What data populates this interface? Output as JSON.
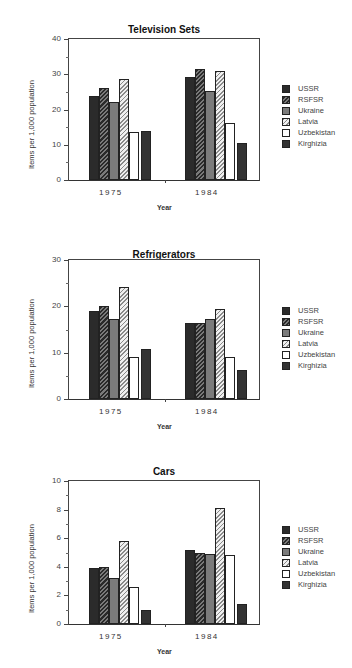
{
  "chart_data": [
    {
      "type": "bar",
      "title": "Television Sets",
      "xlabel": "Year",
      "ylabel": "Items per 1,000 population",
      "categories": [
        "1975",
        "1984"
      ],
      "ylim": [
        0,
        40
      ],
      "yticks": [
        "0",
        "10",
        "20",
        "30",
        "40"
      ],
      "legend_position": "right",
      "series": [
        {
          "name": "USSR",
          "values": [
            23.8,
            29.2
          ]
        },
        {
          "name": "RSFSR",
          "values": [
            26.2,
            31.5
          ]
        },
        {
          "name": "Ukraine",
          "values": [
            22.0,
            25.3
          ]
        },
        {
          "name": "Latvia",
          "values": [
            28.6,
            31.0
          ]
        },
        {
          "name": "Uzbekistan",
          "values": [
            13.6,
            16.3
          ]
        },
        {
          "name": "Kirghizia",
          "values": [
            13.8,
            10.4
          ]
        }
      ]
    },
    {
      "type": "bar",
      "title": "Refrigerators",
      "xlabel": "Year",
      "ylabel": "Items per 1,000 population",
      "categories": [
        "1975",
        "1984"
      ],
      "ylim": [
        0,
        30
      ],
      "yticks": [
        "0",
        "10",
        "20",
        "30"
      ],
      "legend_position": "right",
      "series": [
        {
          "name": "USSR",
          "values": [
            18.9,
            16.4
          ]
        },
        {
          "name": "RSFSR",
          "values": [
            20.0,
            16.4
          ]
        },
        {
          "name": "Ukraine",
          "values": [
            17.2,
            17.3
          ]
        },
        {
          "name": "Latvia",
          "values": [
            24.2,
            19.5
          ]
        },
        {
          "name": "Uzbekistan",
          "values": [
            9.0,
            9.0
          ]
        },
        {
          "name": "Kirghizia",
          "values": [
            10.9,
            6.3
          ]
        }
      ]
    },
    {
      "type": "bar",
      "title": "Cars",
      "xlabel": "Year",
      "ylabel": "Items per 1,000 population",
      "categories": [
        "1975",
        "1984"
      ],
      "ylim": [
        0,
        10
      ],
      "yticks": [
        "0",
        "2",
        "4",
        "6",
        "8",
        "10"
      ],
      "legend_position": "right",
      "series": [
        {
          "name": "USSR",
          "values": [
            3.9,
            5.2
          ]
        },
        {
          "name": "RSFSR",
          "values": [
            4.0,
            5.0
          ]
        },
        {
          "name": "Ukraine",
          "values": [
            3.2,
            4.9
          ]
        },
        {
          "name": "Latvia",
          "values": [
            5.8,
            8.1
          ]
        },
        {
          "name": "Uzbekistan",
          "values": [
            2.6,
            4.8
          ]
        },
        {
          "name": "Kirghizia",
          "values": [
            1.0,
            1.4
          ]
        }
      ]
    }
  ],
  "legend": {
    "items": [
      {
        "label": "USSR",
        "pattern": "p-ussr"
      },
      {
        "label": "RSFSR",
        "pattern": "p-rsfsr"
      },
      {
        "label": "Ukraine",
        "pattern": "p-ukraine"
      },
      {
        "label": "Latvia",
        "pattern": "p-latvia"
      },
      {
        "label": "Uzbekistan",
        "pattern": "p-uzbek"
      },
      {
        "label": "Kirghizia",
        "pattern": "p-kirg"
      }
    ]
  },
  "layout": {
    "panels": [
      {
        "top": 0,
        "title_top": 24,
        "plot_top": 38,
        "plot_h": 143,
        "legend_top": 83
      },
      {
        "top": 0,
        "title_top": 249,
        "plot_top": 259,
        "plot_h": 141,
        "legend_top": 305
      },
      {
        "top": 0,
        "title_top": 466,
        "plot_top": 480,
        "plot_h": 145,
        "legend_top": 524
      }
    ]
  }
}
